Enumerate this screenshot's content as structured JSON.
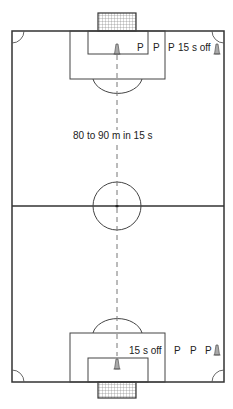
{
  "diagram": {
    "center_label": "80 to 90 m in 15 s",
    "top_players": [
      "P",
      "P",
      "P"
    ],
    "top_rest_label": "15 s off",
    "bottom_rest_label": "15 s off",
    "bottom_players": [
      "P",
      "P",
      "P"
    ],
    "icons": [
      "cone-icon",
      "goal-net-icon"
    ],
    "colors": {
      "line": "#333333",
      "arc": "#555555",
      "cone": "#999999",
      "net": "#777777",
      "background": "#ffffff"
    }
  }
}
